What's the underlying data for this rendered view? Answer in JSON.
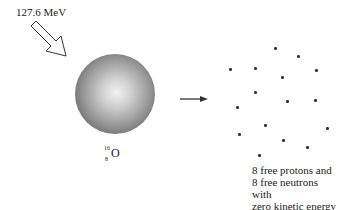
{
  "incoming": {
    "energy_label": "127.6 MeV"
  },
  "nucleus": {
    "mass_number": "16",
    "atomic_number": "8",
    "element": "O"
  },
  "result": {
    "caption_lines": [
      "8 free protons and",
      "8 free neutrons with",
      "zero kinetic energy"
    ],
    "particles": [
      {
        "x": 230,
        "y": 69
      },
      {
        "x": 255,
        "y": 68
      },
      {
        "x": 275,
        "y": 48
      },
      {
        "x": 298,
        "y": 56
      },
      {
        "x": 316,
        "y": 70
      },
      {
        "x": 282,
        "y": 77
      },
      {
        "x": 255,
        "y": 92
      },
      {
        "x": 237,
        "y": 107
      },
      {
        "x": 287,
        "y": 101
      },
      {
        "x": 315,
        "y": 100
      },
      {
        "x": 265,
        "y": 125
      },
      {
        "x": 239,
        "y": 134
      },
      {
        "x": 327,
        "y": 128
      },
      {
        "x": 283,
        "y": 140
      },
      {
        "x": 307,
        "y": 147
      },
      {
        "x": 259,
        "y": 155
      }
    ]
  }
}
